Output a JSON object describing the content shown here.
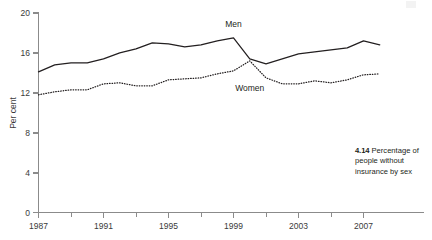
{
  "figure": {
    "caption_number": "4.14",
    "caption_text": "Percentage of people without insurance by sex"
  },
  "chart_data": {
    "type": "line",
    "title": "",
    "subtitle": "",
    "xlabel": "",
    "ylabel": "Per cent",
    "xlim": [
      1987,
      2008
    ],
    "ylim": [
      0,
      20
    ],
    "yticks": [
      0,
      4,
      8,
      12,
      16,
      20
    ],
    "ytick_labels": [
      "0",
      "4",
      "8",
      "12",
      "16",
      "20"
    ],
    "xticks": [
      1987,
      1989,
      1991,
      1993,
      1995,
      1997,
      1999,
      2001,
      2003,
      2005,
      2007
    ],
    "xtick_labels": [
      "1987",
      "",
      "1991",
      "",
      "1995",
      "",
      "1999",
      "",
      "2003",
      "",
      "2007"
    ],
    "xtick_labels_major": [
      "1987",
      "1991",
      "1995",
      "1999",
      "2003",
      "2007"
    ],
    "grid": false,
    "legend_position": "inline-annotation",
    "annotations": [
      {
        "text": "Men",
        "x": 1999.0,
        "y": 18.6
      },
      {
        "text": "Women",
        "x": 2000.0,
        "y": 12.2
      }
    ],
    "x": [
      1987,
      1988,
      1989,
      1990,
      1991,
      1992,
      1993,
      1994,
      1995,
      1996,
      1997,
      1998,
      1999,
      2000,
      2001,
      2002,
      2003,
      2004,
      2005,
      2006,
      2007,
      2008
    ],
    "series": [
      {
        "name": "Men",
        "style": "solid",
        "color": "#231f20",
        "values": [
          14.1,
          14.8,
          15.0,
          15.0,
          15.4,
          16.0,
          16.4,
          17.0,
          16.9,
          16.6,
          16.8,
          17.2,
          17.5,
          15.4,
          14.9,
          15.4,
          15.9,
          16.1,
          16.3,
          16.5,
          17.2,
          16.8
        ]
      },
      {
        "name": "Women",
        "style": "dotted",
        "color": "#231f20",
        "values": [
          11.8,
          12.1,
          12.3,
          12.3,
          12.9,
          13.0,
          12.7,
          12.7,
          13.3,
          13.4,
          13.5,
          13.9,
          14.2,
          15.2,
          13.5,
          12.9,
          12.9,
          13.2,
          13.0,
          13.3,
          13.8,
          13.9
        ]
      }
    ]
  }
}
